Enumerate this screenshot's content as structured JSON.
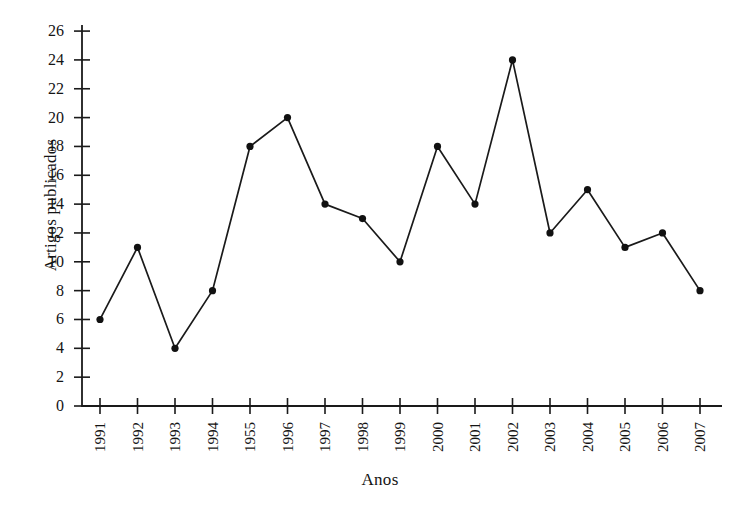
{
  "chart_data": {
    "type": "line",
    "title": "",
    "xlabel": "Anos",
    "ylabel": "Artigos publicados",
    "categories": [
      "1991",
      "1992",
      "1993",
      "1994",
      "1955",
      "1996",
      "1997",
      "1998",
      "1999",
      "2000",
      "2001",
      "2002",
      "2003",
      "2004",
      "2005",
      "2006",
      "2007"
    ],
    "values": [
      6,
      11,
      4,
      8,
      18,
      20,
      14,
      13,
      10,
      18,
      14,
      24,
      12,
      15,
      11,
      12,
      8
    ],
    "series": [
      {
        "name": "Artigos publicados",
        "values": [
          6,
          11,
          4,
          8,
          18,
          20,
          14,
          13,
          10,
          18,
          14,
          24,
          12,
          15,
          11,
          12,
          8
        ]
      }
    ],
    "ylim": [
      0,
      26
    ],
    "ytick_step": 2,
    "yticks": [
      0,
      2,
      4,
      6,
      8,
      10,
      12,
      14,
      16,
      18,
      20,
      22,
      24,
      26
    ],
    "ytick_labels": [
      "0",
      "2",
      "4",
      "6",
      "8",
      "10",
      "12",
      "14",
      "16",
      "18",
      "20",
      "22",
      "24",
      "26"
    ],
    "grid": false,
    "legend": "none",
    "xtick_rotation": -90,
    "marker": "filled-circle",
    "line_color": "#1a1a1a",
    "marker_color": "#111111",
    "background_color": "#ffffff",
    "axis_color": "#1a1a1a"
  },
  "axes": {
    "y_title": "Artigos publicados",
    "x_title": "Anos"
  }
}
